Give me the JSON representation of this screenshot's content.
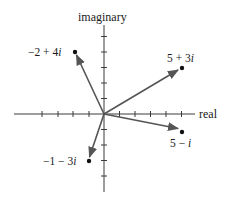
{
  "diagram": {
    "type": "complex-plane",
    "axes": {
      "horizontal_label": "real",
      "vertical_label": "imaginary",
      "x_ticks": [
        -4,
        -3,
        -2,
        -1,
        1,
        2,
        3,
        4,
        5
      ],
      "y_ticks": [
        -4,
        -3,
        -2,
        -1,
        1,
        2,
        3,
        4,
        5
      ]
    },
    "points": [
      {
        "id": "p1",
        "re": -2,
        "im": 4,
        "label_main": "−2 + 4",
        "label_i": "i"
      },
      {
        "id": "p2",
        "re": 5,
        "im": 3,
        "label_main": "5 + 3",
        "label_i": "i"
      },
      {
        "id": "p3",
        "re": 5,
        "im": -1,
        "label_main": "5 − ",
        "label_i": "i"
      },
      {
        "id": "p4",
        "re": -1,
        "im": -3,
        "label_main": "−1 − 3",
        "label_i": "i"
      }
    ],
    "colors": {
      "axis": "#3a3a3a",
      "vector": "#555555",
      "point": "#111111",
      "text": "#1a1a1a"
    }
  }
}
